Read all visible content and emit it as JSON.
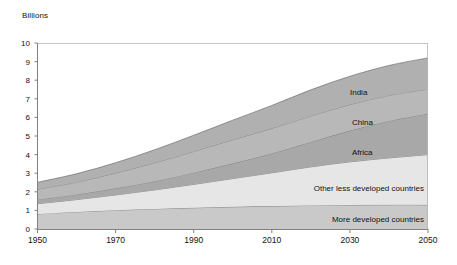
{
  "chart_data": {
    "type": "area",
    "title": "",
    "subtitle": "",
    "ylabel": "Billions",
    "xlabel": "",
    "stacked": true,
    "grid": false,
    "legend_position": "inline-labels",
    "x": [
      1950,
      1960,
      1970,
      1980,
      1990,
      2000,
      2010,
      2020,
      2030,
      2040,
      2050
    ],
    "xlim": [
      1950,
      2050
    ],
    "ylim": [
      0,
      10
    ],
    "xticks": [
      1950,
      1970,
      1990,
      2010,
      2030,
      2050
    ],
    "xtick_labels": [
      "1950",
      "1970",
      "1990",
      "2010",
      "2030",
      "2050"
    ],
    "yticks": [
      0,
      1,
      2,
      3,
      4,
      5,
      6,
      7,
      8,
      9,
      10
    ],
    "ytick_labels": [
      "0",
      "1",
      "2",
      "3",
      "4",
      "5",
      "6",
      "7",
      "8",
      "9",
      "10"
    ],
    "series": [
      {
        "name": "More developed countries",
        "color": "#c9c9c9",
        "values": [
          0.81,
          0.92,
          1.01,
          1.08,
          1.14,
          1.19,
          1.23,
          1.27,
          1.29,
          1.3,
          1.3
        ]
      },
      {
        "name": "Other less developed countries",
        "color": "#e6e6e6",
        "values": [
          0.55,
          0.66,
          0.82,
          1.02,
          1.26,
          1.52,
          1.79,
          2.07,
          2.32,
          2.52,
          2.7
        ],
        "cumulative": [
          1.36,
          1.58,
          1.83,
          2.1,
          2.4,
          2.71,
          3.02,
          3.34,
          3.61,
          3.82,
          4.0
        ]
      },
      {
        "name": "Africa",
        "color": "#a8a8a8",
        "values": [
          0.23,
          0.28,
          0.36,
          0.47,
          0.63,
          0.82,
          1.04,
          1.34,
          1.68,
          1.99,
          2.2
        ],
        "cumulative": [
          1.59,
          1.86,
          2.19,
          2.57,
          3.03,
          3.53,
          4.06,
          4.68,
          5.29,
          5.81,
          6.2
        ]
      },
      {
        "name": "China",
        "color": "#b8b8b8",
        "values": [
          0.55,
          0.66,
          0.82,
          0.99,
          1.14,
          1.27,
          1.35,
          1.4,
          1.4,
          1.37,
          1.32
        ],
        "cumulative": [
          2.14,
          2.52,
          3.01,
          3.56,
          4.17,
          4.8,
          5.41,
          6.08,
          6.69,
          7.18,
          7.52
        ]
      },
      {
        "name": "India",
        "color": "#b0b0b0",
        "values": [
          0.37,
          0.45,
          0.55,
          0.7,
          0.87,
          1.05,
          1.23,
          1.4,
          1.52,
          1.61,
          1.68
        ],
        "cumulative": [
          2.51,
          2.97,
          3.56,
          4.26,
          5.04,
          5.85,
          6.64,
          7.48,
          8.21,
          8.79,
          9.2
        ]
      }
    ],
    "inline_labels": [
      {
        "text": "India",
        "x_px": 350,
        "y_px": 88
      },
      {
        "text": "China",
        "x_px": 352,
        "y_px": 118
      },
      {
        "text": "Africa",
        "x_px": 352,
        "y_px": 148
      },
      {
        "text": "Other less developed countries",
        "x_px": 424,
        "y_px": 184
      },
      {
        "text": "More developed countries",
        "x_px": 424,
        "y_px": 215
      }
    ]
  },
  "axes": {
    "ylabel": "Billions",
    "ytick_labels": [
      "10",
      "9",
      "8",
      "7",
      "6",
      "5",
      "4",
      "3",
      "2",
      "1",
      "0"
    ],
    "xtick_labels": [
      "1950",
      "1970",
      "1990",
      "2010",
      "2030",
      "2050"
    ]
  },
  "colors": {
    "more_developed": "#c9c9c9",
    "other_less_developed": "#e6e6e6",
    "africa": "#a8a8a8",
    "china": "#b8b8b8",
    "india": "#b0b0b0",
    "axis": "#808080",
    "text": "#111111",
    "background": "#ffffff"
  }
}
